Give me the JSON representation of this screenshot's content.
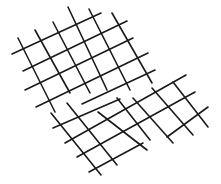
{
  "figure": {
    "stroke_color": "#1a1a1a",
    "background": "#ffffff",
    "stroke_width": 1.6
  },
  "grids": [
    {
      "name": "upper-grid",
      "lines": [
        [
          12,
          54,
          101,
          13
        ],
        [
          23,
          71,
          127,
          21
        ],
        [
          25,
          90,
          133,
          38
        ],
        [
          36,
          107,
          148,
          53
        ],
        [
          82,
          104,
          155,
          70
        ],
        [
          18,
          38,
          55,
          112
        ],
        [
          35,
          30,
          70,
          93
        ],
        [
          53,
          22,
          90,
          93
        ],
        [
          68,
          7,
          107,
          90
        ],
        [
          89,
          9,
          130,
          90
        ],
        [
          112,
          13,
          152,
          83
        ]
      ]
    },
    {
      "name": "lower-grid",
      "lines": [
        [
          53,
          128,
          120,
          99
        ],
        [
          65,
          143,
          186,
          75
        ],
        [
          77,
          157,
          195,
          92
        ],
        [
          89,
          172,
          143,
          143
        ],
        [
          167,
          137,
          208,
          107
        ],
        [
          51,
          113,
          101,
          175
        ],
        [
          67,
          103,
          117,
          165
        ],
        [
          98,
          112,
          147,
          150
        ],
        [
          117,
          98,
          150,
          140
        ],
        [
          133,
          98,
          173,
          143
        ],
        [
          152,
          88,
          193,
          135
        ],
        [
          173,
          82,
          208,
          127
        ]
      ]
    }
  ]
}
